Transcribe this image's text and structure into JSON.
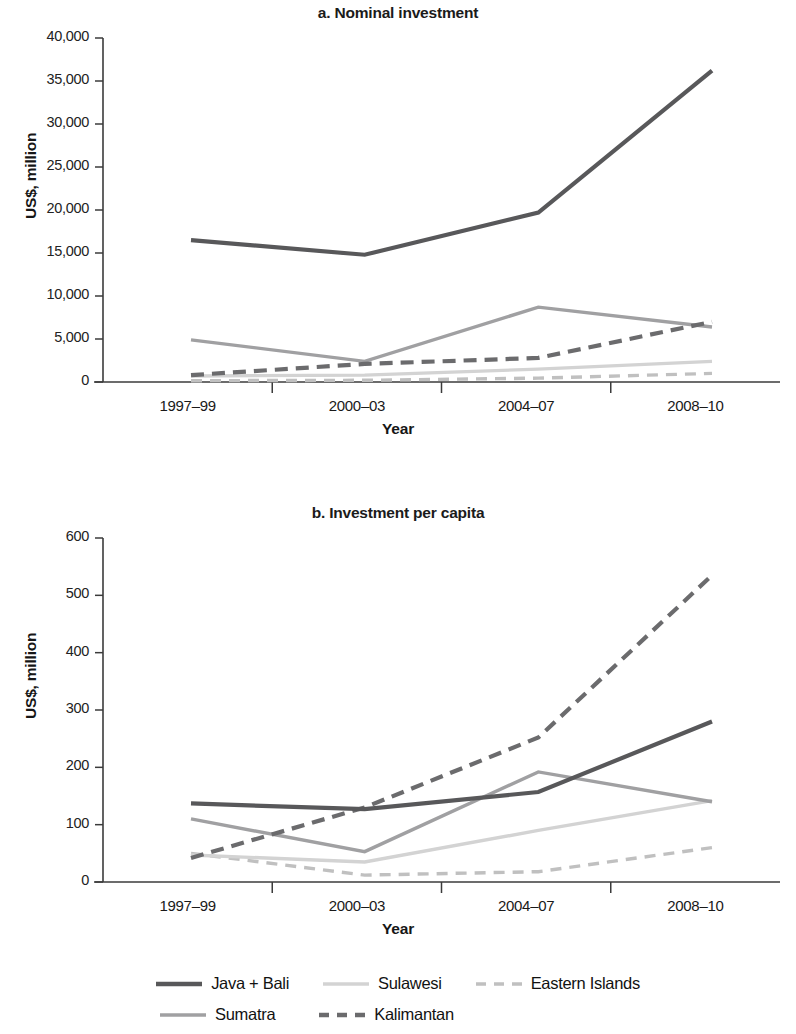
{
  "figure": {
    "panels": [
      {
        "id": "a",
        "title": "a. Nominal investment",
        "ylabel": "US$, million",
        "xlabel": "Year"
      },
      {
        "id": "b",
        "title": "b. Investment per capita",
        "ylabel": "US$, million",
        "xlabel": "Year"
      }
    ],
    "legend": {
      "rows": [
        [
          {
            "label": "Java + Bali",
            "color": "#58585a",
            "style": "solid"
          },
          {
            "label": "Sulawesi",
            "color": "#d3d3d3",
            "style": "solid"
          },
          {
            "label": "Eastern Islands",
            "color": "#c0c0c0",
            "style": "dashed"
          }
        ],
        [
          {
            "label": "Sumatra",
            "color": "#a0a0a2",
            "style": "solid"
          },
          {
            "label": "Kalimantan",
            "color": "#6b6b6d",
            "style": "dashed"
          }
        ]
      ]
    }
  },
  "chart_data": [
    {
      "type": "line",
      "title": "a. Nominal investment",
      "xlabel": "Year",
      "ylabel": "US$, million",
      "categories": [
        "1997–99",
        "2000–03",
        "2004–07",
        "2008–10"
      ],
      "ylim": [
        0,
        40000
      ],
      "yticks": [
        0,
        5000,
        10000,
        15000,
        20000,
        25000,
        30000,
        35000,
        40000
      ],
      "ytick_labels": [
        "0",
        "5,000",
        "10,000",
        "15,000",
        "20,000",
        "25,000",
        "30,000",
        "35,000",
        "40,000"
      ],
      "grid": false,
      "legend_position": "below-figure",
      "series": [
        {
          "name": "Java + Bali",
          "values": [
            16500,
            14800,
            19700,
            36200
          ],
          "color": "#58585a",
          "style": "solid"
        },
        {
          "name": "Sumatra",
          "values": [
            4900,
            2400,
            8700,
            6400
          ],
          "color": "#a0a0a2",
          "style": "solid"
        },
        {
          "name": "Sulawesi",
          "values": [
            700,
            800,
            1500,
            2400
          ],
          "color": "#d3d3d3",
          "style": "solid"
        },
        {
          "name": "Kalimantan",
          "values": [
            800,
            2100,
            2800,
            7000
          ],
          "color": "#6b6b6d",
          "style": "dashed"
        },
        {
          "name": "Eastern Islands",
          "values": [
            150,
            200,
            450,
            1000
          ],
          "color": "#c0c0c0",
          "style": "dashed"
        }
      ]
    },
    {
      "type": "line",
      "title": "b. Investment per capita",
      "xlabel": "Year",
      "ylabel": "US$, million",
      "categories": [
        "1997–99",
        "2000–03",
        "2004–07",
        "2008–10"
      ],
      "ylim": [
        0,
        600
      ],
      "yticks": [
        0,
        100,
        200,
        300,
        400,
        500,
        600
      ],
      "ytick_labels": [
        "0",
        "100",
        "200",
        "300",
        "400",
        "500",
        "600"
      ],
      "grid": false,
      "legend_position": "below-figure",
      "series": [
        {
          "name": "Java + Bali",
          "values": [
            137,
            127,
            157,
            280
          ],
          "color": "#58585a",
          "style": "solid"
        },
        {
          "name": "Sumatra",
          "values": [
            110,
            53,
            192,
            140
          ],
          "color": "#a0a0a2",
          "style": "solid"
        },
        {
          "name": "Sulawesi",
          "values": [
            47,
            35,
            90,
            142
          ],
          "color": "#d3d3d3",
          "style": "solid"
        },
        {
          "name": "Kalimantan",
          "values": [
            42,
            130,
            252,
            535
          ],
          "color": "#6b6b6d",
          "style": "dashed"
        },
        {
          "name": "Eastern Islands",
          "values": [
            50,
            12,
            18,
            60
          ],
          "color": "#c0c0c0",
          "style": "dashed"
        }
      ]
    }
  ]
}
